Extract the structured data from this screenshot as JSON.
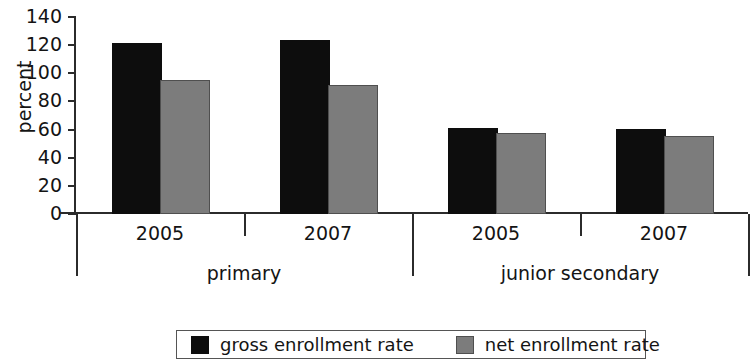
{
  "chart_data": {
    "type": "bar",
    "title": "",
    "subtitle": "",
    "xlabel": "",
    "ylabel": "percent",
    "ylim": [
      0,
      140
    ],
    "yticks": [
      0,
      20,
      40,
      60,
      80,
      100,
      120,
      140
    ],
    "ytick_labels": [
      "0",
      "20",
      "40",
      "60",
      "80",
      "100",
      "120",
      "140"
    ],
    "grid": false,
    "legend_position": "bottom",
    "groups": [
      {
        "label": "primary",
        "categories": [
          "2005",
          "2007"
        ]
      },
      {
        "label": "junior secondary",
        "categories": [
          "2005",
          "2007"
        ]
      }
    ],
    "categories": [
      "2005",
      "2007",
      "2005",
      "2007"
    ],
    "series": [
      {
        "name": "gross enrollment rate",
        "color": "#0d0d0d",
        "values": [
          120,
          122,
          60,
          59
        ]
      },
      {
        "name": "net enrollment rate",
        "color": "#7c7c7c",
        "values": [
          94,
          90,
          56,
          54
        ]
      }
    ],
    "legend": [
      {
        "label": "gross enrollment rate",
        "color": "#0d0d0d",
        "swatch": "gross"
      },
      {
        "label": "net enrollment rate",
        "color": "#7c7c7c",
        "swatch": "net"
      }
    ]
  }
}
